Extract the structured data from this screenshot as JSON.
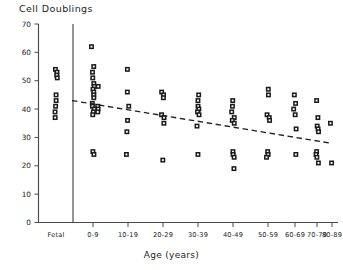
{
  "chart_data": {
    "type": "scatter",
    "title": "Cell Doublings",
    "xlabel": "Age (years)",
    "ylabel": "Cell Doublings",
    "ylim": [
      0,
      70
    ],
    "yticks": [
      0,
      10,
      20,
      30,
      40,
      50,
      60,
      70
    ],
    "grid": false,
    "legend": "none",
    "categories": [
      "Fetal",
      "0-9",
      "10-19",
      "20-29",
      "30-39",
      "40-49",
      "50-59",
      "60-69",
      "70-79",
      "80-89"
    ],
    "series": [
      {
        "name": "Cell doublings by donor age",
        "marker": "open-square",
        "groups": [
          {
            "category": "Fetal",
            "values": [
              54,
              53,
              52,
              51,
              45,
              43,
              41,
              39,
              37
            ]
          },
          {
            "category": "0-9",
            "values": [
              62,
              55,
              53,
              51,
              49,
              48,
              48,
              47,
              46,
              45,
              44,
              42,
              41,
              41,
              40,
              40,
              39,
              39,
              38,
              25,
              24
            ]
          },
          {
            "category": "10-19",
            "values": [
              54,
              46,
              41,
              36,
              32,
              24
            ]
          },
          {
            "category": "20-29",
            "values": [
              46,
              45,
              44,
              38,
              37,
              35,
              22
            ]
          },
          {
            "category": "30-39",
            "values": [
              45,
              43,
              41,
              40,
              39,
              38,
              34,
              24
            ]
          },
          {
            "category": "40-49",
            "values": [
              43,
              41,
              39,
              37,
              36,
              35,
              25,
              24,
              23,
              19
            ]
          },
          {
            "category": "50-59",
            "values": [
              47,
              45,
              38,
              37,
              36,
              25,
              24,
              23
            ]
          },
          {
            "category": "60-69",
            "values": [
              45,
              42,
              40,
              38,
              33,
              24
            ]
          },
          {
            "category": "70-79",
            "values": [
              43,
              37,
              34,
              33,
              32,
              25,
              24,
              23,
              21
            ]
          },
          {
            "category": "80-89",
            "values": [
              35,
              21
            ]
          }
        ]
      }
    ],
    "trendline": {
      "style": "dashed",
      "x_start_category": "0-9",
      "x_end_category": "80-89",
      "y_start": 43,
      "y_end": 28
    }
  },
  "caption": ""
}
